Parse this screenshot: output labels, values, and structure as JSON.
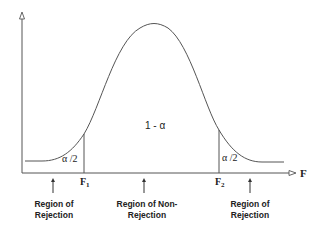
{
  "diagram": {
    "axis": {
      "x_label": "F"
    },
    "curve": {
      "stroke": "#555555"
    },
    "critical_values": {
      "lower": {
        "label": "F",
        "subscript": "1"
      },
      "upper": {
        "label": "F",
        "subscript": "2"
      }
    },
    "area_labels": {
      "left_tail": "α /2",
      "center": "1 - α",
      "right_tail": "α /2"
    },
    "regions": [
      {
        "line1": "Region of",
        "line2": "Rejection"
      },
      {
        "line1": "Region of Non-",
        "line2": "Rejection"
      },
      {
        "line1": "Region of",
        "line2": "Rejection"
      }
    ],
    "colors": {
      "line": "#555555",
      "text": "#222222",
      "background": "#ffffff"
    }
  }
}
